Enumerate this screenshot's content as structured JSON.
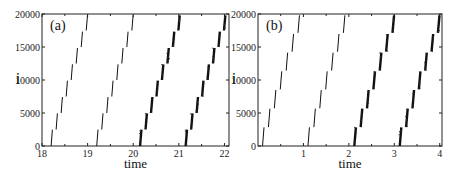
{
  "chart_data": [
    {
      "type": "scatter",
      "panel_label": "(a)",
      "xlabel": "time",
      "ylabel": "i",
      "xlim": [
        18,
        22.1
      ],
      "ylim": [
        0,
        20000
      ],
      "xticks": [
        "18",
        "19",
        "20",
        "21",
        "22"
      ],
      "yticks": [
        "0",
        "5000",
        "10000",
        "15000",
        "20000"
      ],
      "grid": false,
      "series": [
        {
          "name": "wave1",
          "start_time": 18.2,
          "steps": 8,
          "step_dt": 0.11,
          "style": "thin"
        },
        {
          "name": "wave2",
          "start_time": 19.2,
          "steps": 8,
          "step_dt": 0.11,
          "style": "thin"
        },
        {
          "name": "wave3",
          "start_time": 20.15,
          "steps": 8,
          "step_dt": 0.12,
          "style": "thick"
        },
        {
          "name": "wave4",
          "start_time": 21.15,
          "steps": 8,
          "step_dt": 0.12,
          "style": "thick"
        }
      ]
    },
    {
      "type": "scatter",
      "panel_label": "(b)",
      "xlabel": "time",
      "ylabel": "i",
      "xlim": [
        0,
        4.05
      ],
      "ylim": [
        0,
        20000
      ],
      "xticks": [
        "1",
        "2",
        "3",
        "4"
      ],
      "yticks": [
        "0",
        "5000",
        "10000",
        "15000",
        "20000"
      ],
      "grid": false,
      "series": [
        {
          "name": "wave1",
          "start_time": 0.1,
          "steps": 7,
          "step_dt": 0.13,
          "style": "thin"
        },
        {
          "name": "wave2",
          "start_time": 1.1,
          "steps": 7,
          "step_dt": 0.13,
          "style": "thin"
        },
        {
          "name": "wave3",
          "start_time": 2.12,
          "steps": 7,
          "step_dt": 0.14,
          "style": "thick"
        },
        {
          "name": "wave4",
          "start_time": 3.12,
          "steps": 7,
          "step_dt": 0.14,
          "style": "thick"
        }
      ]
    }
  ]
}
